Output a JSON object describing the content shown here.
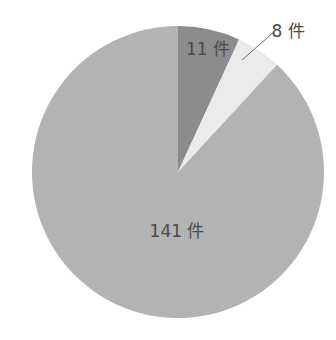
{
  "chart_data": {
    "type": "pie",
    "title": "",
    "unit": "件",
    "start_angle_deg": 0,
    "direction": "clockwise",
    "legend": "none",
    "slices": [
      {
        "label": "11 件",
        "value": 11,
        "color": "#8c8c8c",
        "label_position": "inside",
        "label_x": 208,
        "label_y": 55
      },
      {
        "label": "8 件",
        "value": 8,
        "color": "#ebebeb",
        "label_position": "outside-leader",
        "label_x": 288,
        "label_y": 37,
        "leader": {
          "x1": 242,
          "y1": 60,
          "x2": 275,
          "y2": 31
        }
      },
      {
        "label": "141 件",
        "value": 141,
        "color": "#b3b3b3",
        "label_position": "inside",
        "label_x": 177,
        "label_y": 237
      }
    ],
    "total": 160
  },
  "geometry": {
    "cx": 178,
    "cy": 172,
    "r": 146
  },
  "style": {
    "leader_color": "#6e6e6e",
    "label_color": "#4a4a4a"
  }
}
